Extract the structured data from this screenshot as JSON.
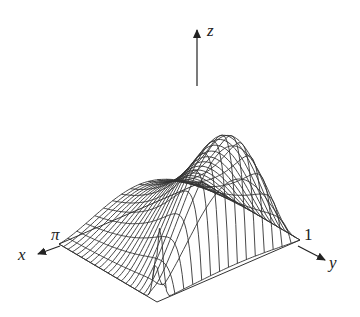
{
  "figure": {
    "type": "3d-wireframe-surface",
    "axes": {
      "x": {
        "label": "x",
        "tick_label": "π"
      },
      "y": {
        "label": "y",
        "tick_label": "1"
      },
      "z": {
        "label": "z"
      }
    },
    "colors": {
      "line": "#333333",
      "background": "#ffffff"
    }
  },
  "chart_data": {
    "type": "surface",
    "title": "",
    "xlabel": "x",
    "ylabel": "y",
    "zlabel": "z",
    "x_range": [
      0,
      "π"
    ],
    "y_range": [
      0,
      1
    ],
    "x_ticks": [
      "π"
    ],
    "y_ticks": [
      "1"
    ],
    "grid": false
  }
}
